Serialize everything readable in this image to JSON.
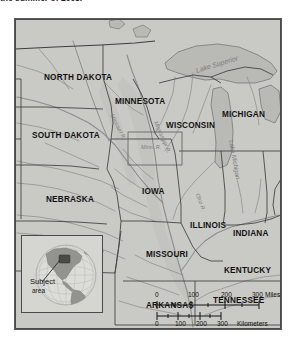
{
  "caption": {
    "text": "the summer of 2008."
  },
  "map": {
    "title": "Upper Midwest / Mississippi River Basin reference map",
    "frame": {
      "x": 14,
      "y": 18,
      "width": 268,
      "height": 312
    },
    "background_color": "#c8c8c4",
    "land_color": "#c9c9c5",
    "water_color": "#b4b4b0",
    "border_color": "#5a5a5a",
    "state_line_color": "#4f4f4f",
    "river_color": "#8c8c8c",
    "states": [
      {
        "name": "NORTH DAKOTA",
        "x": 29,
        "y": 55,
        "size": 8.2
      },
      {
        "name": "SOUTH DAKOTA",
        "x": 17,
        "y": 113,
        "size": 8.2
      },
      {
        "name": "NEBRASKA",
        "x": 31,
        "y": 177,
        "size": 8.2
      },
      {
        "name": "KANSAS",
        "x": 53,
        "y": 228,
        "size": 8.2
      },
      {
        "name": "MINNESOTA",
        "x": 100,
        "y": 79,
        "size": 8.2
      },
      {
        "name": "IOWA",
        "x": 127,
        "y": 169,
        "size": 8.2
      },
      {
        "name": "MISSOURI",
        "x": 131,
        "y": 232,
        "size": 8.2
      },
      {
        "name": "ARKANSAS",
        "x": 131,
        "y": 283,
        "size": 8.2
      },
      {
        "name": "WISCONSIN",
        "x": 151,
        "y": 103,
        "size": 8.2
      },
      {
        "name": "ILLINOIS",
        "x": 175,
        "y": 203,
        "size": 8.2
      },
      {
        "name": "MICHIGAN",
        "x": 207,
        "y": 92,
        "size": 8.2
      },
      {
        "name": "INDIANA",
        "x": 218,
        "y": 211,
        "size": 8.2
      },
      {
        "name": "KENTUCKY",
        "x": 209,
        "y": 248,
        "size": 8.2
      },
      {
        "name": "TENNESSEE",
        "x": 198,
        "y": 278,
        "size": 8.2
      }
    ],
    "water_features": [
      {
        "name": "Lake Superior",
        "x": 181,
        "y": 48,
        "size": 7.0,
        "rotate": -17
      },
      {
        "name": "Lake Michigan",
        "x": 216,
        "y": 118,
        "size": 6.2,
        "rotate": 80
      },
      {
        "name": "Missouri R.",
        "x": 96,
        "y": 93,
        "size": 5.6,
        "rotate": 62
      },
      {
        "name": "Mississippi R.",
        "x": 140,
        "y": 100,
        "size": 5.6,
        "rotate": 66
      },
      {
        "name": "Ohio R.",
        "x": 182,
        "y": 172,
        "size": 5.4,
        "rotate": 70
      }
    ],
    "detail_inset": {
      "label": "Minn. R.",
      "x": 113,
      "y": 113,
      "width": 54,
      "height": 33
    }
  },
  "locator_inset": {
    "title_line1": "Subject",
    "title_line2": "area",
    "globe_ocean_color": "#d9d9d5",
    "globe_land_color": "#8f8f8b",
    "highlight_color": "#4d4d4d"
  },
  "scale_bar": {
    "miles": {
      "unit": "Miles",
      "ticks": [
        "0",
        "100",
        "200",
        "300"
      ]
    },
    "kilometers": {
      "unit": "Kilometers",
      "ticks": [
        "0",
        "100",
        "200",
        "300"
      ]
    }
  }
}
